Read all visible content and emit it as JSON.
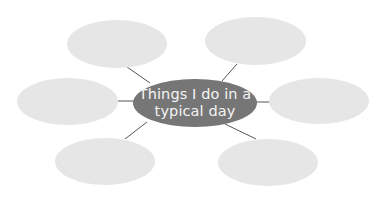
{
  "diagram": {
    "type": "spider-map",
    "center": {
      "line1": "Things I do in a",
      "line2": "typical day",
      "color": "#767676",
      "text_color": "#f4f4f4"
    },
    "bubble_color": "#e6e6e6",
    "line_color": "#555555",
    "bubbles": [
      {
        "position": "top-left",
        "text": ""
      },
      {
        "position": "top-right",
        "text": ""
      },
      {
        "position": "middle-left",
        "text": ""
      },
      {
        "position": "middle-right",
        "text": ""
      },
      {
        "position": "bottom-left",
        "text": ""
      },
      {
        "position": "bottom-right",
        "text": ""
      }
    ]
  }
}
